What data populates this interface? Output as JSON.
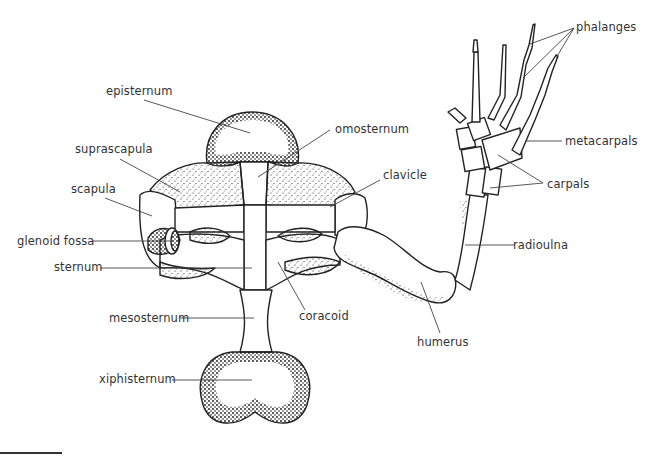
{
  "figure": {
    "line_color": "#333333",
    "stipple_color": "#222222",
    "background": "#ffffff"
  },
  "labels": {
    "episternum": "episternum",
    "omosternum": "omosternum",
    "suprascapula": "suprascapula",
    "clavicle": "clavicle",
    "scapula": "scapula",
    "glenoid_fossa": "glenoid fossa",
    "sternum": "sternum",
    "mesosternum": "mesosternum",
    "coracoid": "coracoid",
    "xiphisternum": "xiphisternum",
    "humerus": "humerus",
    "radioulna": "radioulna",
    "phalanges": "phalanges",
    "metacarpals": "metacarpals",
    "carpals": "carpals"
  }
}
